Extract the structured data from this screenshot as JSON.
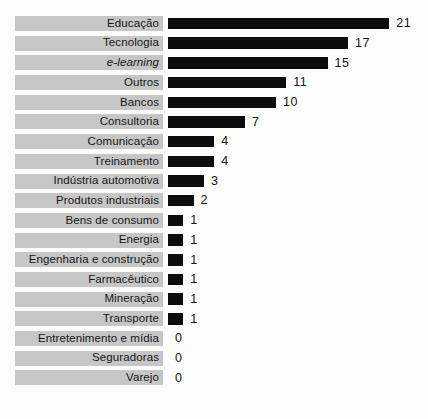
{
  "chart_data": {
    "type": "bar",
    "orientation": "horizontal",
    "title": "",
    "xlabel": "",
    "ylabel": "",
    "grid": false,
    "legend": false,
    "value_labels_shown": true,
    "xlim": [
      0,
      21
    ],
    "bar_color": "#0d0d0c",
    "label_band_color": "#c6c6c6",
    "text_color": "#161616",
    "categories": [
      "Educação",
      "Tecnologia",
      "e-learning",
      "Outros",
      "Bancos",
      "Consultoria",
      "Comunicação",
      "Treinamento",
      "Indústria automotiva",
      "Produtos industriais",
      "Bens de consumo",
      "Energia",
      "Engenharia e construção",
      "Farmacêutico",
      "Mineração",
      "Transporte",
      "Entretenimento e mídia",
      "Seguradoras",
      "Varejo"
    ],
    "values": [
      21,
      17,
      15,
      11,
      10,
      7,
      4,
      4,
      3,
      2,
      1,
      1,
      1,
      1,
      1,
      1,
      0,
      0,
      0
    ],
    "italic_categories": [
      "e-learning"
    ]
  }
}
